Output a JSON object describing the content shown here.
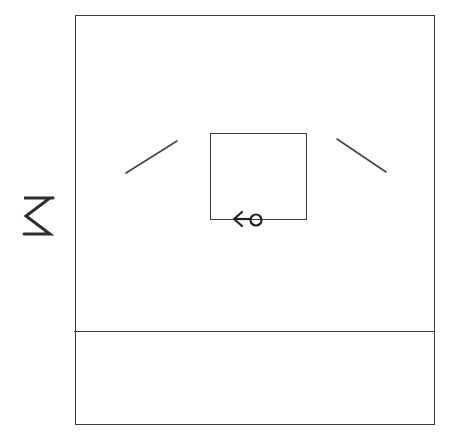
{
  "sketch": {
    "type": "hand-drawn wireframe",
    "side_label": {
      "text": "M",
      "rotation_deg": 90
    },
    "main_frame": {
      "regions": [
        "content-area",
        "bottom-panel"
      ]
    },
    "content_area": {
      "media_box": {
        "icon": "arrow-left-with-circle-icon",
        "icon_glyph": "←o"
      },
      "left_stroke": "diagonal-line-left",
      "right_stroke": "diagonal-line-right"
    },
    "bottom_panel": {
      "text": ""
    },
    "colors": {
      "ink": "#3a3a3a",
      "paper": "#ffffff"
    }
  }
}
